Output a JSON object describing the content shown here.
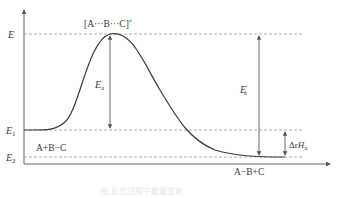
{
  "diagram": {
    "type": "energy-profile",
    "axes": {
      "y_labels": {
        "E": "E",
        "E1_main": "E",
        "E1_sub": "1",
        "E2_main": "E",
        "E2_sub": "2"
      }
    },
    "transition_state": {
      "text": "[A···B···C]",
      "superscript": "≠"
    },
    "reactants": "A+B−C",
    "products": "A−B+C",
    "activation_forward": {
      "main": "E",
      "sub": "a"
    },
    "activation_reverse": {
      "main": "E",
      "sub": "a",
      "sup": "′"
    },
    "enthalpy_change": {
      "prefix": "Δr",
      "main": "H",
      "sub": "a"
    },
    "caption": "图  反应过程中能量变化",
    "colors": {
      "line": "#3a3a3a",
      "dashed": "#9a9a9a",
      "arrow": "#555555",
      "caption": "#e6e6e6"
    }
  }
}
